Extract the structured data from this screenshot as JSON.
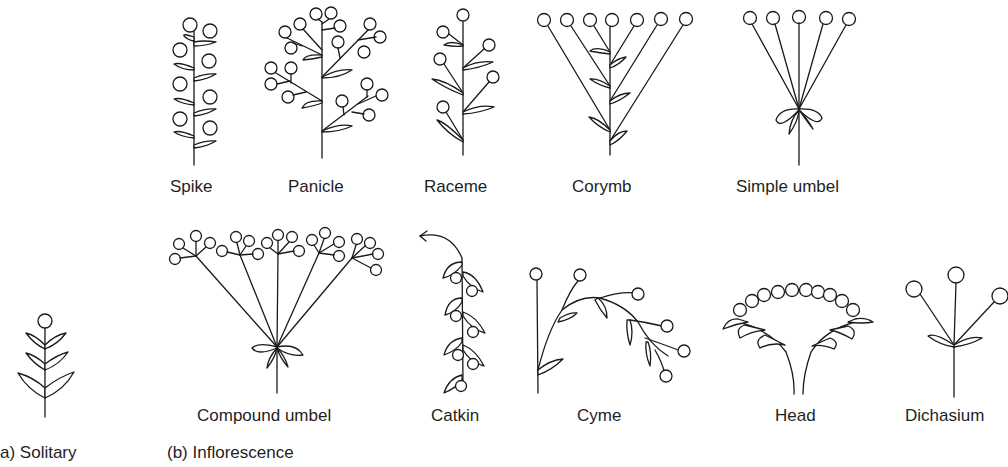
{
  "figure": {
    "section_a": {
      "label": "a) Solitary"
    },
    "section_b": {
      "label": "(b) Inflorescence"
    },
    "types": [
      {
        "id": "spike",
        "label": "Spike"
      },
      {
        "id": "panicle",
        "label": "Panicle"
      },
      {
        "id": "raceme",
        "label": "Raceme"
      },
      {
        "id": "corymb",
        "label": "Corymb"
      },
      {
        "id": "simple-umbel",
        "label": "Simple umbel"
      },
      {
        "id": "compound-umbel",
        "label": "Compound umbel"
      },
      {
        "id": "catkin",
        "label": "Catkin"
      },
      {
        "id": "cyme",
        "label": "Cyme"
      },
      {
        "id": "head",
        "label": "Head"
      },
      {
        "id": "dichasium",
        "label": "Dichasium"
      }
    ],
    "solitary": {
      "label": "Solitary"
    }
  }
}
